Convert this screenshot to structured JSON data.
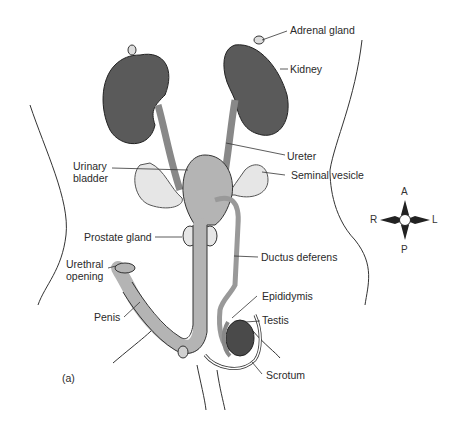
{
  "figure": {
    "panel_label": "(a)",
    "labels": {
      "adrenal_gland": "Adrenal gland",
      "kidney": "Kidney",
      "ureter": "Ureter",
      "urinary_bladder_1": "Urinary",
      "urinary_bladder_2": "bladder",
      "seminal_vesicle": "Seminal vesicle",
      "prostate_gland": "Prostate gland",
      "ductus_deferens": "Ductus deferens",
      "urethral_opening_1": "Urethral",
      "urethral_opening_2": "opening",
      "penis": "Penis",
      "epididymis": "Epididymis",
      "testis": "Testis",
      "scrotum": "Scrotum"
    },
    "compass": {
      "anterior": "A",
      "posterior": "P",
      "right": "R",
      "left": "L"
    },
    "colors": {
      "kidney": "#5a5a5a",
      "organ_fill": "#b4b4b4",
      "vesicle_fill": "#e6e6e6",
      "outline": "#2a2a2a",
      "leader": "#333333"
    }
  }
}
